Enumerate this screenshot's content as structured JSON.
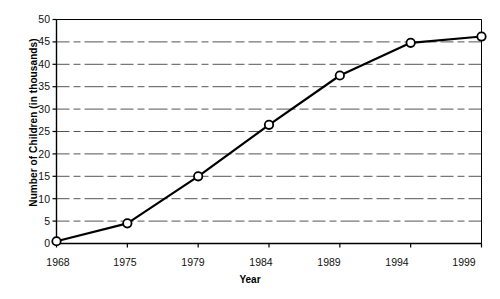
{
  "chart_data": {
    "type": "line",
    "title": "",
    "xlabel": "Year",
    "ylabel": "Number of Children (in thousands)",
    "x": [
      1968,
      1975,
      1979,
      1984,
      1989,
      1994,
      1999
    ],
    "categories": [
      "1968",
      "1975",
      "1979",
      "1984",
      "1989",
      "1994",
      "1999"
    ],
    "values": [
      0.5,
      4.5,
      15,
      26.5,
      37.5,
      44.8,
      46.2
    ],
    "series": [
      {
        "name": "Number of Children (in thousands)",
        "values": [
          0.5,
          4.5,
          15,
          26.5,
          37.5,
          44.8,
          46.2
        ]
      }
    ],
    "ylim": [
      0,
      50
    ],
    "yticks": [
      0,
      5,
      10,
      15,
      20,
      25,
      30,
      35,
      40,
      45,
      50
    ],
    "ytick_labels": [
      "0",
      "5",
      "10",
      "15",
      "20",
      "25",
      "30",
      "35",
      "40",
      "45",
      "50"
    ],
    "xtick_labels": [
      "1968",
      "1975",
      "1979",
      "1984",
      "1989",
      "1994",
      "1999"
    ],
    "grid": true,
    "grid_style": "dashed-horizontal",
    "legend": false,
    "legend_position": "none",
    "marker": "open-circle",
    "line_color": "#000000",
    "marker_face_color": "#ffffff",
    "marker_edge_color": "#000000",
    "grid_color": "#555555",
    "axis_color": "#000000",
    "background_color": "#ffffff"
  }
}
